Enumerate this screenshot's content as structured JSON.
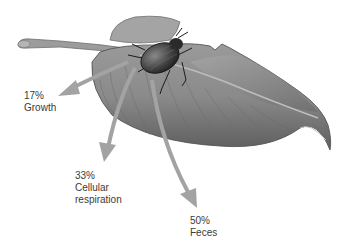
{
  "diagram": {
    "colors": {
      "background": "#ffffff",
      "arrow": "#a3a3a3",
      "text": "#3a3a3a",
      "leaf_light": "#c9c9c9",
      "leaf_dark": "#6e6e6e",
      "beetle": "#3b3b3b"
    },
    "labels": [
      {
        "id": "growth",
        "percent": "17%",
        "lines": [
          "Growth"
        ]
      },
      {
        "id": "respiration",
        "percent": "33%",
        "lines": [
          "Cellular",
          "respiration"
        ]
      },
      {
        "id": "feces",
        "percent": "50%",
        "lines": [
          "Feces"
        ]
      }
    ]
  }
}
